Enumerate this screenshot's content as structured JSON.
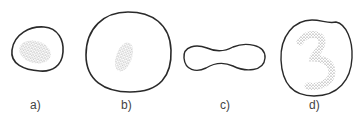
{
  "figure": {
    "panels": [
      {
        "id": "a",
        "label": "a)",
        "description": "small oval outline with dense stippled interior region"
      },
      {
        "id": "b",
        "label": "b)",
        "description": "large round outline with small stippled oval region"
      },
      {
        "id": "c",
        "label": "c)",
        "description": "dumbbell / peanut-shaped outline, empty"
      },
      {
        "id": "d",
        "label": "d)",
        "description": "round outline with stippled curved '3'-shaped region"
      }
    ],
    "colors": {
      "outline": "#2a2a2a",
      "stipple": "#555555",
      "label": "#444444"
    }
  }
}
